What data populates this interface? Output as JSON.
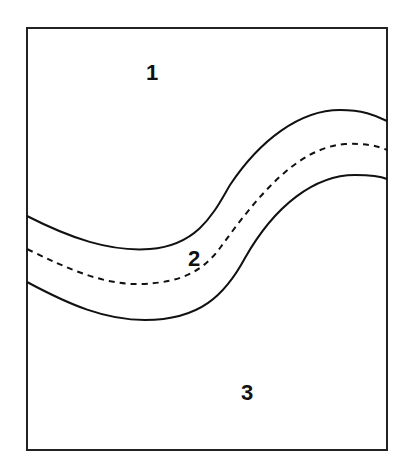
{
  "diagram": {
    "type": "region schematic",
    "frame": {
      "stroke": "#222222"
    },
    "boundaries": [
      {
        "name": "upper-boundary",
        "style": "solid"
      },
      {
        "name": "centerline",
        "style": "dashed"
      },
      {
        "name": "lower-boundary",
        "style": "solid"
      }
    ],
    "regions": [
      {
        "id": "region-1",
        "label": "1",
        "position": "above channel"
      },
      {
        "id": "region-2",
        "label": "2",
        "position": "inside channel"
      },
      {
        "id": "region-3",
        "label": "3",
        "position": "below channel"
      }
    ]
  }
}
